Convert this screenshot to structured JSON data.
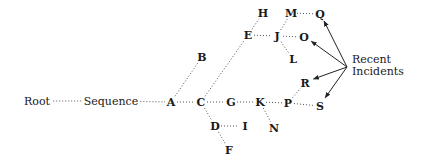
{
  "diagram": {
    "type": "tree",
    "annotation": {
      "line1": "Recent",
      "line2": "Incidents",
      "x": 352,
      "y1": 63,
      "y2": 75,
      "origin": [
        347,
        67
      ]
    },
    "nodes": [
      {
        "id": "Root",
        "label": "Root",
        "x": 37,
        "y": 104,
        "style": "word"
      },
      {
        "id": "Sequence",
        "label": "Sequence",
        "x": 111,
        "y": 104,
        "style": "word"
      },
      {
        "id": "A",
        "label": "A",
        "x": 171,
        "y": 105
      },
      {
        "id": "B",
        "label": "B",
        "x": 202,
        "y": 60
      },
      {
        "id": "C",
        "label": "C",
        "x": 201,
        "y": 105
      },
      {
        "id": "D",
        "label": "D",
        "x": 215,
        "y": 129
      },
      {
        "id": "E",
        "label": "E",
        "x": 248,
        "y": 38
      },
      {
        "id": "F",
        "label": "F",
        "x": 229,
        "y": 153
      },
      {
        "id": "G",
        "label": "G",
        "x": 231,
        "y": 105
      },
      {
        "id": "H",
        "label": "H",
        "x": 263,
        "y": 16
      },
      {
        "id": "I",
        "label": "I",
        "x": 245,
        "y": 129
      },
      {
        "id": "J",
        "label": "J",
        "x": 277,
        "y": 39
      },
      {
        "id": "K",
        "label": "K",
        "x": 260,
        "y": 105
      },
      {
        "id": "L",
        "label": "L",
        "x": 293,
        "y": 62
      },
      {
        "id": "M",
        "label": "M",
        "x": 291,
        "y": 16
      },
      {
        "id": "N",
        "label": "N",
        "x": 274,
        "y": 131
      },
      {
        "id": "O",
        "label": "O",
        "x": 304,
        "y": 40
      },
      {
        "id": "P",
        "label": "P",
        "x": 288,
        "y": 106
      },
      {
        "id": "Q",
        "label": "Q",
        "x": 320,
        "y": 17
      },
      {
        "id": "R",
        "label": "R",
        "x": 305,
        "y": 86
      },
      {
        "id": "S",
        "label": "S",
        "x": 320,
        "y": 109
      }
    ],
    "edges": [
      [
        "Root",
        "Sequence"
      ],
      [
        "Sequence",
        "A"
      ],
      [
        "A",
        "B"
      ],
      [
        "A",
        "C"
      ],
      [
        "C",
        "E"
      ],
      [
        "C",
        "G"
      ],
      [
        "C",
        "D"
      ],
      [
        "D",
        "I"
      ],
      [
        "D",
        "F"
      ],
      [
        "E",
        "H"
      ],
      [
        "E",
        "J"
      ],
      [
        "J",
        "M"
      ],
      [
        "J",
        "O"
      ],
      [
        "J",
        "L"
      ],
      [
        "M",
        "Q"
      ],
      [
        "G",
        "K"
      ],
      [
        "K",
        "P"
      ],
      [
        "K",
        "N"
      ],
      [
        "P",
        "R"
      ],
      [
        "P",
        "S"
      ]
    ],
    "recent_incidents": [
      "Q",
      "O",
      "R",
      "S"
    ]
  }
}
